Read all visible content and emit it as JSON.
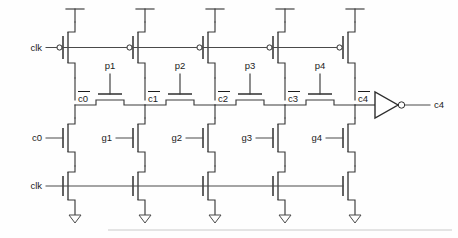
{
  "diagram": {
    "type": "circuit-schematic",
    "line_color": "#3a3a3a",
    "background_color": "#ffffff"
  },
  "labels": {
    "clk_top": "clk",
    "clk_bottom": "clk",
    "carry_in": "c0",
    "carry_out": "c4"
  },
  "precharge_row": {
    "device_type": "pmos",
    "count": 5,
    "gate_signal": "clk",
    "supply": "vdd"
  },
  "propagate_row": {
    "device_type": "pass-nmos",
    "gates": [
      "p1",
      "p2",
      "p3",
      "p4"
    ],
    "nodes": [
      "c̅0",
      "c̅1",
      "c̅2",
      "c̅3",
      "c̅4"
    ],
    "node_plain": [
      "c0",
      "c1",
      "c2",
      "c3",
      "c4"
    ]
  },
  "generate_row": {
    "device_type": "nmos",
    "gates": [
      "g1",
      "g2",
      "g3",
      "g4"
    ],
    "first_gate": "c0"
  },
  "evaluate_row": {
    "device_type": "nmos",
    "count": 5,
    "gate_signal": "clk",
    "supply": "gnd"
  },
  "output_stage": {
    "element": "inverter",
    "input_node": "c̅4",
    "output_node": "c4"
  }
}
